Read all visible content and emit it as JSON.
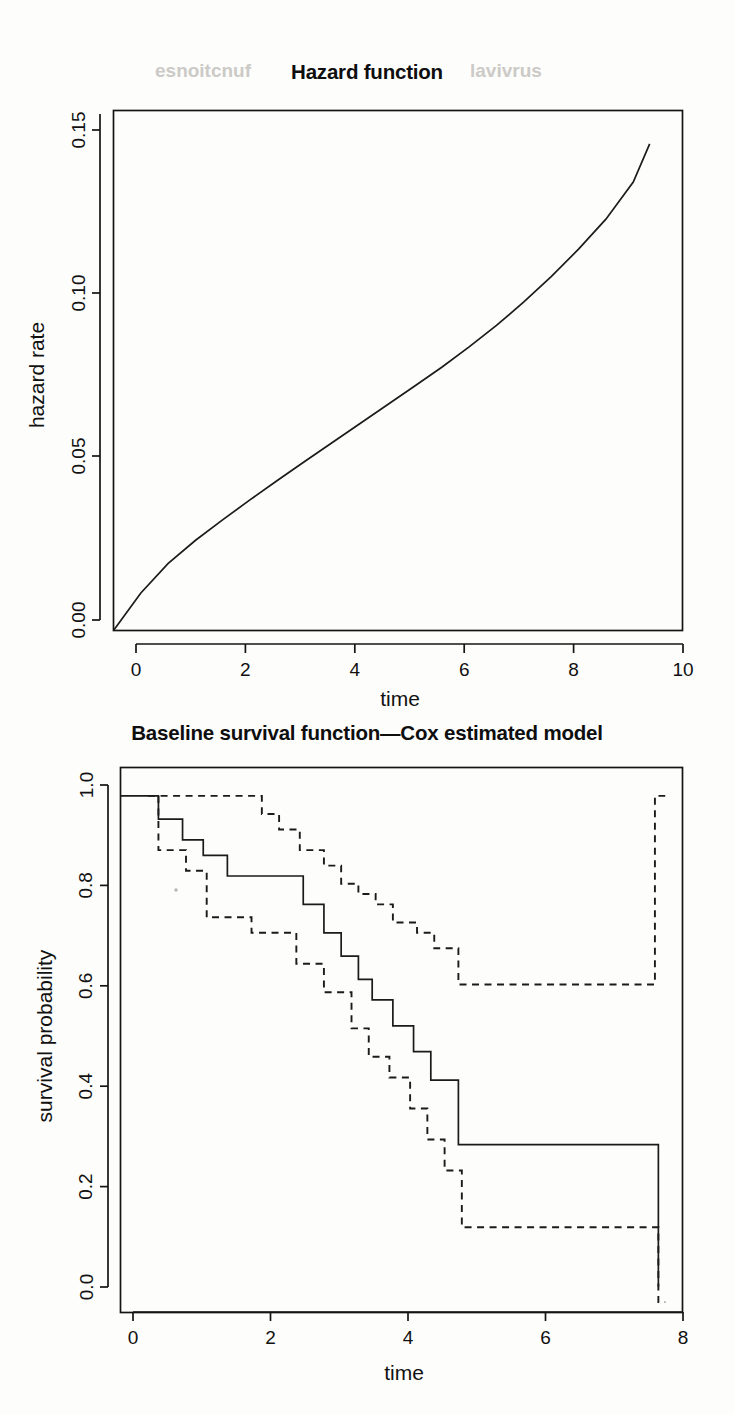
{
  "document": {
    "kind": "scanned-figure-page",
    "width": 734,
    "height": 1415,
    "ghost_text": "baseline hazard and survival functions"
  },
  "figures": [
    {
      "id": "hazard",
      "title": "Hazard function"
    },
    {
      "id": "survival",
      "title": "Baseline survival function—Cox estimated model"
    }
  ],
  "chart_data": [
    {
      "type": "line",
      "id": "hazard",
      "title": "Hazard function",
      "xlabel": "time",
      "ylabel": "hazard rate",
      "xlim": [
        0,
        10.4
      ],
      "ylim": [
        0,
        0.1665
      ],
      "xticks": [
        0,
        2,
        4,
        6,
        8,
        10
      ],
      "xticklabels": [
        "0",
        "2",
        "4",
        "6",
        "8",
        "10"
      ],
      "yticks": [
        0.0,
        0.05,
        0.1,
        0.15
      ],
      "yticklabels": [
        "0.00",
        "0.05",
        "0.10",
        "0.15"
      ],
      "grid": false,
      "legend": null,
      "series": [
        {
          "name": "hazard rate",
          "style": "solid",
          "x": [
            0.0,
            0.5,
            1.0,
            1.5,
            2.0,
            2.5,
            3.0,
            3.5,
            4.0,
            4.5,
            5.0,
            5.5,
            6.0,
            6.5,
            7.0,
            7.5,
            8.0,
            8.5,
            9.0,
            9.5,
            9.8
          ],
          "y": [
            0.0,
            0.012,
            0.0215,
            0.0289,
            0.0355,
            0.0419,
            0.0481,
            0.0542,
            0.0602,
            0.0662,
            0.0722,
            0.0782,
            0.0843,
            0.0908,
            0.0977,
            0.1052,
            0.1133,
            0.1221,
            0.1317,
            0.1436,
            0.1558
          ]
        }
      ]
    },
    {
      "type": "line",
      "id": "survival",
      "title": "Baseline survival function—Cox estimated model",
      "xlabel": "time",
      "ylabel": "survival probability",
      "xlim": [
        0,
        8.15
      ],
      "ylim": [
        0,
        1.055
      ],
      "xticks": [
        0,
        2,
        4,
        6,
        8
      ],
      "xticklabels": [
        "0",
        "2",
        "4",
        "6",
        "8"
      ],
      "yticks": [
        0.0,
        0.2,
        0.4,
        0.6,
        0.8,
        1.0
      ],
      "yticklabels": [
        "0.0",
        "0.2",
        "0.4",
        "0.6",
        "0.8",
        "1.0"
      ],
      "grid": false,
      "legend": null,
      "series": [
        {
          "name": "baseline survival estimate",
          "style": "solid",
          "step": "post",
          "x": [
            0.0,
            0.55,
            0.55,
            0.9,
            0.9,
            1.2,
            1.2,
            1.55,
            1.55,
            2.65,
            2.65,
            2.95,
            2.95,
            3.2,
            3.2,
            3.45,
            3.45,
            3.65,
            3.65,
            3.95,
            3.95,
            4.25,
            4.25,
            4.5,
            4.5,
            4.9,
            4.9,
            7.8,
            7.8
          ],
          "y": [
            1.0,
            1.0,
            0.955,
            0.955,
            0.915,
            0.915,
            0.885,
            0.885,
            0.845,
            0.845,
            0.79,
            0.79,
            0.735,
            0.735,
            0.69,
            0.69,
            0.645,
            0.645,
            0.605,
            0.605,
            0.555,
            0.555,
            0.505,
            0.505,
            0.45,
            0.45,
            0.325,
            0.325,
            0.05
          ]
        },
        {
          "name": "upper confidence limit",
          "style": "dashed",
          "step": "post",
          "x": [
            0.4,
            2.05,
            2.05,
            2.3,
            2.3,
            2.6,
            2.6,
            2.95,
            2.95,
            3.2,
            3.2,
            3.45,
            3.45,
            3.7,
            3.7,
            3.95,
            3.95,
            4.3,
            4.3,
            4.55,
            4.55,
            4.9,
            4.9,
            7.75,
            7.75,
            7.9
          ],
          "y": [
            1.0,
            1.0,
            0.965,
            0.965,
            0.935,
            0.935,
            0.895,
            0.895,
            0.865,
            0.865,
            0.83,
            0.83,
            0.81,
            0.81,
            0.79,
            0.79,
            0.755,
            0.755,
            0.735,
            0.735,
            0.705,
            0.705,
            0.635,
            0.635,
            1.0,
            1.0
          ]
        },
        {
          "name": "lower confidence limit",
          "style": "dashed",
          "step": "post",
          "x": [
            0.55,
            0.55,
            0.95,
            0.95,
            1.25,
            1.25,
            1.9,
            1.9,
            2.55,
            2.55,
            2.95,
            2.95,
            3.35,
            3.35,
            3.6,
            3.6,
            3.9,
            3.9,
            4.2,
            4.2,
            4.45,
            4.45,
            4.7,
            4.7,
            4.95,
            4.95,
            7.8,
            7.8,
            7.9
          ],
          "y": [
            1.0,
            0.895,
            0.895,
            0.855,
            0.855,
            0.765,
            0.765,
            0.735,
            0.735,
            0.675,
            0.675,
            0.62,
            0.62,
            0.55,
            0.55,
            0.495,
            0.495,
            0.455,
            0.455,
            0.395,
            0.395,
            0.335,
            0.335,
            0.275,
            0.275,
            0.165,
            0.165,
            0.02,
            0.02
          ]
        }
      ]
    }
  ]
}
